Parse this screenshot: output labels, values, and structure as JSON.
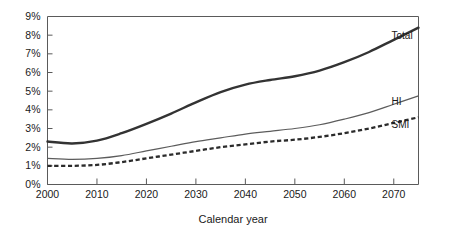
{
  "chart_data": {
    "type": "line",
    "title": "",
    "subtitle": "",
    "xlabel": "Calendar year",
    "ylabel": "",
    "xlim": [
      2000,
      2075
    ],
    "ylim": [
      0,
      9
    ],
    "grid": false,
    "legend_position": "right-inline-end-of-line",
    "x_ticks": [
      2000,
      2010,
      2020,
      2030,
      2040,
      2050,
      2060,
      2070
    ],
    "x_tick_labels": [
      "2000",
      "2010",
      "2020",
      "2030",
      "2040",
      "2050",
      "2060",
      "2070"
    ],
    "y_ticks": [
      0,
      1,
      2,
      3,
      4,
      5,
      6,
      7,
      8,
      9
    ],
    "y_tick_labels": [
      "0%",
      "1%",
      "2%",
      "3%",
      "4%",
      "5%",
      "6%",
      "7%",
      "8%",
      "9%"
    ],
    "x": [
      2000,
      2005,
      2010,
      2015,
      2020,
      2025,
      2030,
      2035,
      2040,
      2045,
      2050,
      2055,
      2060,
      2065,
      2070,
      2075
    ],
    "series": [
      {
        "name": "Total",
        "label": "Total",
        "style": "solid-thick",
        "color": "#333333",
        "values": [
          2.3,
          2.2,
          2.35,
          2.75,
          3.25,
          3.8,
          4.4,
          4.95,
          5.35,
          5.6,
          5.8,
          6.1,
          6.55,
          7.1,
          7.75,
          8.4
        ]
      },
      {
        "name": "HI",
        "label": "HI",
        "style": "solid-thin",
        "color": "#5c5c5c",
        "values": [
          1.4,
          1.35,
          1.4,
          1.55,
          1.8,
          2.05,
          2.3,
          2.5,
          2.7,
          2.85,
          3.0,
          3.2,
          3.5,
          3.85,
          4.3,
          4.75
        ]
      },
      {
        "name": "SMI",
        "label": "SMI",
        "style": "dashed",
        "color": "#2b2b2b",
        "values": [
          1.0,
          1.0,
          1.05,
          1.2,
          1.4,
          1.6,
          1.8,
          2.0,
          2.15,
          2.3,
          2.4,
          2.55,
          2.75,
          3.0,
          3.3,
          3.6
        ]
      }
    ]
  },
  "axis": {
    "x_title": "Calendar year"
  }
}
